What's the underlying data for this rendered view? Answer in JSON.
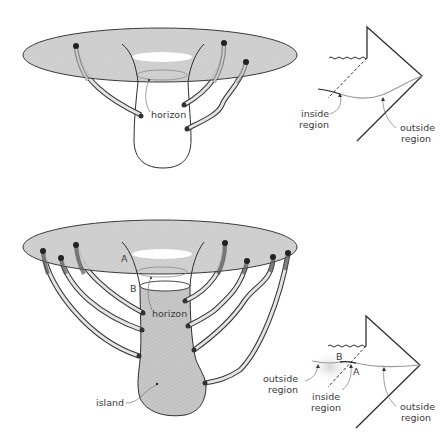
{
  "figure": {
    "top_panel": {
      "embedding": {
        "labels": {
          "horizon": "horizon"
        },
        "wormhole_count": 4
      },
      "penrose": {
        "labels": {
          "inside_region_line1": "inside",
          "inside_region_line2": "region",
          "outside_region_line1": "outside",
          "outside_region_line2": "region"
        }
      }
    },
    "bottom_panel": {
      "embedding": {
        "labels": {
          "point_a": "A",
          "point_b": "B",
          "horizon": "horizon",
          "island": "island"
        },
        "wormhole_count": 8
      },
      "penrose": {
        "labels": {
          "point_a": "A",
          "point_b": "B",
          "island_outside_line1": "outside",
          "island_outside_line2": "region",
          "inside_region_line1": "inside",
          "inside_region_line2": "region",
          "outside_region_line1": "outside",
          "outside_region_line2": "region"
        }
      }
    },
    "colors": {
      "disc_fill": "#c9c9c9",
      "island_fill": "#c4c4c4",
      "ink": "#2e2e2e",
      "grey_line": "#8a8a8a"
    }
  }
}
